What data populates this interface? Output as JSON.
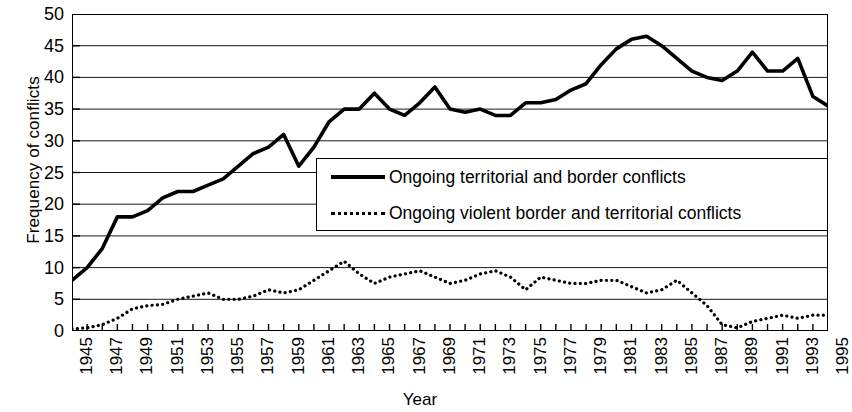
{
  "chart_data": {
    "type": "line",
    "title": "",
    "xlabel": "Year",
    "ylabel": "Frequency of conflicts",
    "grid": true,
    "legend_position": "inside-center-right",
    "xlim": [
      1945,
      1995
    ],
    "ylim": [
      0,
      50
    ],
    "ytick_values": [
      0,
      5,
      10,
      15,
      20,
      25,
      30,
      35,
      40,
      45,
      50
    ],
    "ytick_labels": [
      "0",
      "5",
      "10",
      "15",
      "20",
      "25",
      "30",
      "35",
      "40",
      "45",
      "50"
    ],
    "xtick_labels": [
      "1945",
      "1947",
      "1949",
      "1951",
      "1953",
      "1955",
      "1957",
      "1959",
      "1961",
      "1963",
      "1965",
      "1967",
      "1969",
      "1971",
      "1973",
      "1975",
      "1977",
      "1979",
      "1981",
      "1983",
      "1985",
      "1987",
      "1989",
      "1991",
      "1993",
      "1995"
    ],
    "x": [
      1945,
      1946,
      1947,
      1948,
      1949,
      1950,
      1951,
      1952,
      1953,
      1954,
      1955,
      1956,
      1957,
      1958,
      1959,
      1960,
      1961,
      1962,
      1963,
      1964,
      1965,
      1966,
      1967,
      1968,
      1969,
      1970,
      1971,
      1972,
      1973,
      1974,
      1975,
      1976,
      1977,
      1978,
      1979,
      1980,
      1981,
      1982,
      1983,
      1984,
      1985,
      1986,
      1987,
      1988,
      1989,
      1990,
      1991,
      1992,
      1993,
      1994,
      1995
    ],
    "series": [
      {
        "name": "Ongoing territorial and border conflicts",
        "style": "solid",
        "color": "#000000",
        "values": [
          8,
          10,
          13,
          18,
          18,
          19,
          21,
          22,
          22,
          23,
          24,
          26,
          28,
          29,
          31,
          26,
          29,
          33,
          35,
          35,
          37.5,
          35,
          34,
          36,
          38.5,
          35,
          34.5,
          35,
          34,
          34,
          36,
          36,
          36.5,
          38,
          39,
          42,
          44.5,
          46,
          46.5,
          45,
          43,
          41,
          40,
          39.5,
          41,
          44,
          41,
          41,
          43,
          37,
          35.5
        ]
      },
      {
        "name": "Ongoing violent border and territorial conflicts",
        "style": "dotted",
        "color": "#000000",
        "values": [
          0.3,
          0.5,
          1,
          2,
          3.5,
          4,
          4.2,
          5,
          5.5,
          6,
          5,
          5,
          5.5,
          6.5,
          6,
          6.5,
          8,
          9.5,
          11,
          9,
          7.5,
          8.5,
          9,
          9.5,
          8.5,
          7.5,
          8,
          9,
          9.5,
          8.5,
          6.5,
          8.5,
          8,
          7.5,
          7.5,
          8,
          8,
          7,
          6,
          6.5,
          8,
          6,
          4,
          1,
          0.5,
          1.5,
          2,
          2.5,
          2,
          2.5,
          2.5
        ]
      }
    ]
  },
  "legend": {
    "entries": [
      {
        "key": "solid-line-key",
        "label": "Ongoing territorial and border conflicts"
      },
      {
        "key": "dotted-line-key",
        "label": "Ongoing violent border and territorial conflicts"
      }
    ]
  }
}
